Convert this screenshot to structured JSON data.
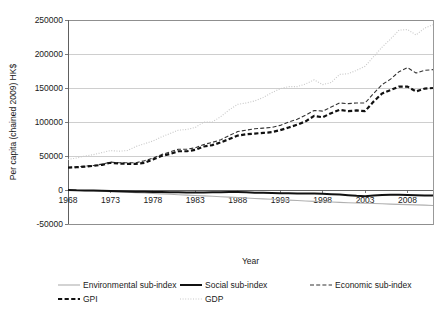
{
  "chart_data": {
    "type": "line",
    "title": "",
    "xlabel": "Year",
    "ylabel": "Per capita (chained 2009) HK$",
    "xlim": [
      1968,
      2011
    ],
    "ylim": [
      -50000,
      250000
    ],
    "grid": true,
    "legend_position": "bottom",
    "y_ticks": [
      -50000,
      0,
      50000,
      100000,
      150000,
      200000,
      250000
    ],
    "y_tick_labels": [
      "-50000",
      "0",
      "50000",
      "100000",
      "150000",
      "200000",
      "250000"
    ],
    "x_ticks": [
      1968,
      1973,
      1978,
      1983,
      1988,
      1993,
      1998,
      2003,
      2008
    ],
    "x_tick_labels": [
      "1968",
      "1973",
      "1978",
      "1983",
      "1988",
      "1993",
      "1998",
      "2003",
      "2008"
    ],
    "x": [
      1968,
      1969,
      1970,
      1971,
      1972,
      1973,
      1974,
      1975,
      1976,
      1977,
      1978,
      1979,
      1980,
      1981,
      1982,
      1983,
      1984,
      1985,
      1986,
      1987,
      1988,
      1989,
      1990,
      1991,
      1992,
      1993,
      1994,
      1995,
      1996,
      1997,
      1998,
      1999,
      2000,
      2001,
      2002,
      2003,
      2004,
      2005,
      2006,
      2007,
      2008,
      2009,
      2010,
      2011
    ],
    "series": [
      {
        "name": "GDP",
        "style": "dotted",
        "color": "#c8c8c8",
        "width": 1.1,
        "values": [
          45000,
          47000,
          50000,
          52000,
          55000,
          58000,
          57000,
          58000,
          64000,
          68000,
          72000,
          78000,
          83000,
          88000,
          89000,
          92000,
          100000,
          100000,
          108000,
          118000,
          126000,
          128000,
          131000,
          136000,
          143000,
          149000,
          152000,
          152000,
          156000,
          162000,
          155000,
          158000,
          170000,
          171000,
          176000,
          182000,
          196000,
          210000,
          222000,
          235000,
          236000,
          228000,
          238000,
          243000
        ]
      },
      {
        "name": "Economic sub-index",
        "style": "dashed-thin",
        "color": "#333333",
        "width": 1.1,
        "values": [
          33000,
          34000,
          35000,
          36000,
          38000,
          41000,
          40000,
          40000,
          40000,
          43000,
          47000,
          52000,
          56000,
          60000,
          60000,
          62000,
          67000,
          70000,
          74000,
          80000,
          86000,
          88000,
          90000,
          91000,
          92000,
          95000,
          100000,
          104000,
          110000,
          117000,
          116000,
          122000,
          128000,
          127000,
          128000,
          128000,
          142000,
          155000,
          163000,
          174000,
          180000,
          172000,
          176000,
          177000
        ]
      },
      {
        "name": "GPI",
        "style": "dashed-bold",
        "color": "#111111",
        "width": 2.2,
        "values": [
          33000,
          33500,
          34500,
          35500,
          37000,
          40000,
          39000,
          38500,
          38500,
          40000,
          45000,
          50000,
          53000,
          57000,
          57000,
          59000,
          64000,
          66000,
          70000,
          75000,
          80000,
          82000,
          83000,
          84000,
          85000,
          88000,
          92000,
          96000,
          101000,
          109000,
          107000,
          113000,
          118000,
          116000,
          117000,
          116000,
          130000,
          142000,
          147000,
          152000,
          152000,
          145000,
          149000,
          150000
        ]
      },
      {
        "name": "Social sub-index",
        "style": "solid-bold",
        "color": "#111111",
        "width": 2.0,
        "values": [
          0,
          -500,
          -700,
          -900,
          -1100,
          -1400,
          -1800,
          -2200,
          -2400,
          -2600,
          -2900,
          -3100,
          -3200,
          -3400,
          -3600,
          -3700,
          -3600,
          -3400,
          -3200,
          -3000,
          -2900,
          -3400,
          -3900,
          -4200,
          -4500,
          -4700,
          -4800,
          -5000,
          -5100,
          -5200,
          -5600,
          -6200,
          -6800,
          -7600,
          -8600,
          -9200,
          -8200,
          -7200,
          -7000,
          -7100,
          -7400,
          -7800,
          -8000,
          -8200
        ]
      },
      {
        "name": "Environmental sub-index",
        "style": "solid-thin",
        "color": "#b0b0b0",
        "width": 1.1,
        "values": [
          0,
          -400,
          -900,
          -1400,
          -1900,
          -2400,
          -2900,
          -3400,
          -3900,
          -4500,
          -5100,
          -5700,
          -6300,
          -6900,
          -7500,
          -8100,
          -8700,
          -9300,
          -9900,
          -10500,
          -11100,
          -11800,
          -12500,
          -13100,
          -13700,
          -14300,
          -14900,
          -15500,
          -16100,
          -16700,
          -17200,
          -17700,
          -18200,
          -18700,
          -19100,
          -19500,
          -19900,
          -20300,
          -20700,
          -21100,
          -21500,
          -21900,
          -22300,
          -22700
        ]
      }
    ]
  },
  "legend": {
    "items": [
      {
        "label": "Environmental sub-index",
        "style": "solid-thin",
        "color": "#b0b0b0"
      },
      {
        "label": "Social sub-index",
        "style": "solid-bold",
        "color": "#111111"
      },
      {
        "label": "Economic sub-index",
        "style": "dashed-thin",
        "color": "#333333"
      },
      {
        "label": "GPI",
        "style": "dashed-bold",
        "color": "#111111"
      },
      {
        "label": "GDP",
        "style": "dotted",
        "color": "#c8c8c8"
      }
    ]
  }
}
